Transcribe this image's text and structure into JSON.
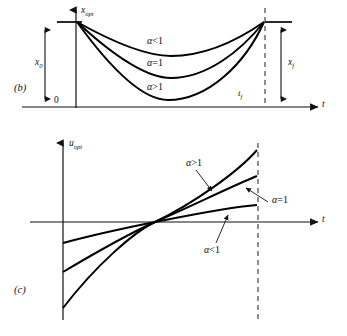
{
  "figure": {
    "panels": [
      {
        "tag": "(b)",
        "y_axis_label": "x",
        "y_axis_sub": "opt",
        "x_axis_label": "t",
        "origin_label": "0",
        "initial_value_label": "x",
        "initial_value_sub": "0",
        "final_value_label": "x",
        "final_value_sub": "f",
        "final_time_label": "t",
        "final_time_sub": "f",
        "curve_labels": [
          {
            "alpha": "α",
            "rel": "<",
            "num": "1"
          },
          {
            "alpha": "α",
            "rel": "=",
            "num": "1"
          },
          {
            "alpha": "α",
            "rel": ">",
            "num": "1"
          }
        ]
      },
      {
        "tag": "(c)",
        "y_axis_label": "u",
        "y_axis_sub": "opt",
        "x_axis_label": "t",
        "curve_labels": [
          {
            "alpha": "α",
            "rel": ">",
            "num": "1"
          },
          {
            "alpha": "α",
            "rel": "=",
            "num": "1"
          },
          {
            "alpha": "α",
            "rel": "<",
            "num": "1"
          }
        ]
      }
    ],
    "colors": {
      "ink": "#111111",
      "curve": "#000000",
      "dashed": "#333333",
      "background": "#ffffff"
    }
  }
}
